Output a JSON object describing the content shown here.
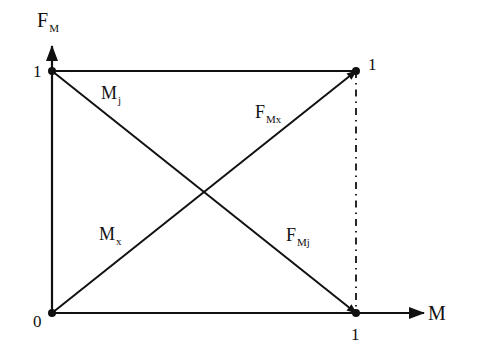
{
  "diagram": {
    "axes": {
      "x": {
        "label": "M",
        "ticks": [
          {
            "value": 0,
            "label": "0"
          },
          {
            "value": 1,
            "label": "1"
          }
        ]
      },
      "y": {
        "label_main": "F",
        "label_sub": "M",
        "ticks": [
          {
            "value": 1,
            "label": "1"
          }
        ]
      }
    },
    "corner_label_top_right": "1",
    "lines": [
      {
        "id": "Mj",
        "from": [
          0,
          1
        ],
        "to": [
          1,
          0
        ],
        "style": "solid",
        "arrow": "end",
        "label_main": "M",
        "label_sub": "j"
      },
      {
        "id": "Mx",
        "from": [
          0,
          0
        ],
        "to": [
          1,
          1
        ],
        "style": "solid",
        "arrow": "end",
        "label_main": "M",
        "label_sub": "x"
      },
      {
        "id": "FMx",
        "label_main": "F",
        "label_sub": "Mx"
      },
      {
        "id": "FMj",
        "label_main": "F",
        "label_sub": "Mj"
      },
      {
        "id": "top-edge",
        "from": [
          0,
          1
        ],
        "to": [
          1,
          1
        ],
        "style": "solid",
        "arrow": "none"
      },
      {
        "id": "right-edge",
        "from": [
          1,
          1
        ],
        "to": [
          1,
          0
        ],
        "style": "dash-dot",
        "arrow": "none"
      }
    ],
    "points": [
      [
        0,
        0
      ],
      [
        0,
        1
      ],
      [
        1,
        1
      ],
      [
        1,
        0
      ]
    ],
    "colors": {
      "ink": "#111111",
      "background": "#ffffff"
    }
  }
}
